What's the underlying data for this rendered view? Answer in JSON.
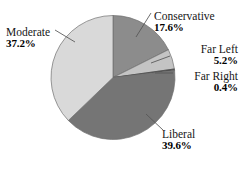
{
  "chart_data": {
    "type": "pie",
    "title": "",
    "subtitle": "",
    "xlabel": "",
    "ylabel": "",
    "legend_position": "none",
    "grid": false,
    "labels_inline": true,
    "units": "percent",
    "categories": [
      "Conservative",
      "Far Left",
      "Far Right",
      "Liberal",
      "Moderate"
    ],
    "values": [
      17.6,
      5.2,
      0.4,
      39.6,
      37.2
    ],
    "start_angle_deg": 0,
    "direction": "clockwise",
    "slices": [
      {
        "name": "Conservative",
        "label": "Conservative",
        "value": 17.6,
        "value_text": "17.6%",
        "color": "#8c8c8c",
        "start_deg": 0.0,
        "end_deg": 63.36
      },
      {
        "name": "Far Left",
        "label": "Far Left",
        "value": 5.2,
        "value_text": "5.2%",
        "color": "#c4c4c4",
        "start_deg": 63.36,
        "end_deg": 82.08
      },
      {
        "name": "Far Right",
        "label": "Far Right",
        "value": 0.4,
        "value_text": "0.4%",
        "color": "#4a4a4a",
        "start_deg": 82.08,
        "end_deg": 83.52
      },
      {
        "name": "Liberal",
        "label": "Liberal",
        "value": 39.6,
        "value_text": "39.6%",
        "color": "#757575",
        "start_deg": 83.52,
        "end_deg": 226.08
      },
      {
        "name": "Moderate",
        "label": "Moderate",
        "value": 37.2,
        "value_text": "37.2%",
        "color": "#d9d9d9",
        "start_deg": 226.08,
        "end_deg": 360.0
      }
    ],
    "geometry": {
      "center_x": 113,
      "center_y": 77.5,
      "radius": 62
    },
    "colors": {
      "background": "#ffffff",
      "outline": "#6e6e6e",
      "leader_line": "#555555",
      "text": "#161616"
    }
  }
}
